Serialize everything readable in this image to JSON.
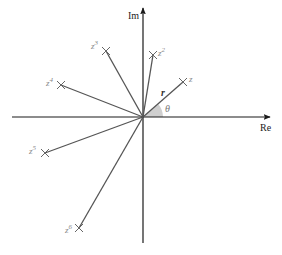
{
  "diagram": {
    "axes": {
      "real_label": "Re",
      "imag_label": "Im"
    },
    "origin": {
      "x": 143,
      "y": 117
    },
    "modulus_label": "r",
    "angle_label": "θ",
    "colors": {
      "axis": "#1a1a1a",
      "vector": "#555555",
      "marker": "#666666",
      "label": "#888888",
      "angle_fill": "#cfcfcf"
    },
    "points": [
      {
        "name": "z",
        "base": "z",
        "exp": "",
        "x": 183,
        "y": 82
      },
      {
        "name": "z2",
        "base": "z",
        "exp": "2",
        "x": 153,
        "y": 55
      },
      {
        "name": "z3",
        "base": "z",
        "exp": "3",
        "x": 106,
        "y": 51
      },
      {
        "name": "z4",
        "base": "z",
        "exp": "4",
        "x": 61,
        "y": 85
      },
      {
        "name": "z5",
        "base": "z",
        "exp": "5",
        "x": 45,
        "y": 153
      },
      {
        "name": "z6",
        "base": "z",
        "exp": "6",
        "x": 79,
        "y": 228
      }
    ]
  }
}
